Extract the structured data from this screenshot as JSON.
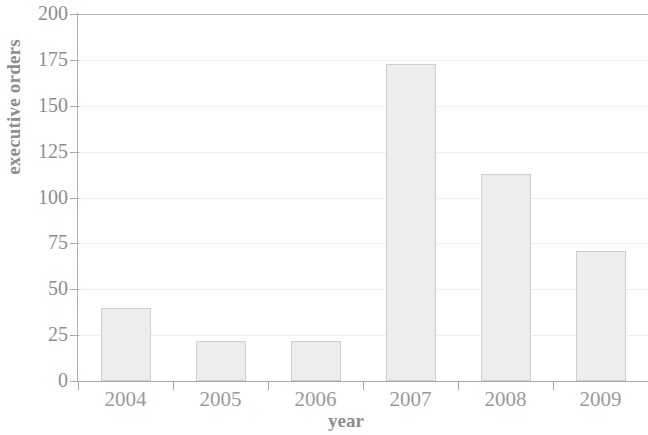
{
  "chart_data": {
    "type": "bar",
    "title": "",
    "xlabel": "year",
    "ylabel": "executive orders",
    "categories": [
      "2004",
      "2005",
      "2006",
      "2007",
      "2008",
      "2009"
    ],
    "values": [
      40,
      22,
      22,
      173,
      113,
      71
    ],
    "ylim": [
      0,
      200
    ],
    "yticks": [
      0,
      25,
      50,
      75,
      100,
      125,
      150,
      175,
      200
    ],
    "ytick_labels": [
      "0",
      "25",
      "50",
      "75",
      "100",
      "125",
      "150",
      "175",
      "200"
    ],
    "grid": true,
    "legend": null,
    "bar_color": "#ededed",
    "bar_edge_color": "#cfcfcf",
    "axis_color": "#a9a9a9",
    "text_color": "#8e8e8e",
    "grid_color": "#e3e3e3",
    "background": "#ffffff"
  }
}
